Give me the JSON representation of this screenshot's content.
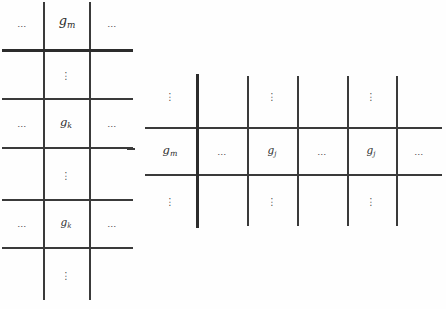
{
  "colors": {
    "background": "#fefefe",
    "line": "#3a3a3a",
    "thick_line": "#2c2c2c",
    "text": "#2b2b2b",
    "dots": "#4a4a4a"
  },
  "left_grid": {
    "row1": {
      "left_dots": "…",
      "label": {
        "base": "g",
        "sub": "m"
      },
      "right_dots": "…"
    },
    "row2": {
      "dots": "⋮"
    },
    "row3": {
      "left_dots": "…",
      "label": {
        "base": "g",
        "sub": "k"
      },
      "right_dots": "…"
    },
    "row4": {
      "dots": "⋮"
    },
    "row5": {
      "left_dots": "…",
      "label": {
        "base": "g",
        "sub": "k"
      },
      "right_dots": "…"
    },
    "row6": {
      "dots": "⋮"
    }
  },
  "right_grid": {
    "top_row": {
      "dots1": "⋮",
      "dots2": "⋮",
      "dots3": "⋮"
    },
    "middle_row": {
      "cell1": {
        "base": "g",
        "sub": "m"
      },
      "cell2": "…",
      "cell3": {
        "base": "g",
        "sub": "j"
      },
      "cell4": "…",
      "cell5": {
        "base": "g",
        "sub": "j"
      },
      "cell6": "…"
    },
    "bottom_row": {
      "dots1": "⋮",
      "dots2": "⋮",
      "dots3": "⋮"
    }
  }
}
